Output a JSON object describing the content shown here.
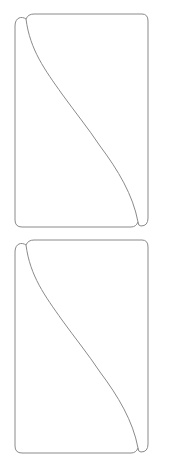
{
  "diagram": {
    "stroke_color": "#8a8a8a",
    "background": "#ffffff",
    "panels": [
      {
        "id": "panel-top",
        "y_offset": 0
      },
      {
        "id": "panel-bottom",
        "y_offset": 226
      }
    ]
  }
}
